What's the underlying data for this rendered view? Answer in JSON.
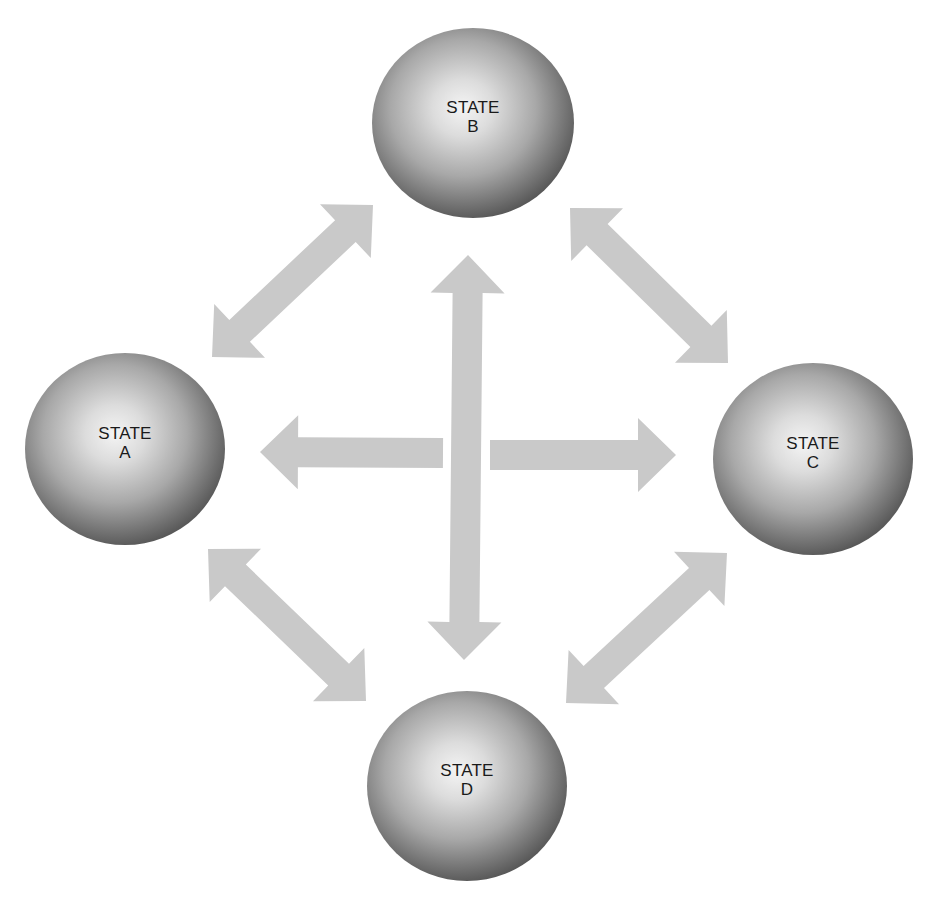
{
  "diagram": {
    "type": "state-transition",
    "colors": {
      "background": "#ffffff",
      "arrow": "#c9c9c9",
      "sphere_highlight": "#f4f4f4",
      "sphere_mid": "#b0b0b0",
      "sphere_edge": "#5a5a5a",
      "label": "#1a1a1a"
    },
    "states": [
      {
        "id": "A",
        "line1": "STATE",
        "line2": "A",
        "cx": 125,
        "cy": 449,
        "rx": 100,
        "ry": 96
      },
      {
        "id": "B",
        "line1": "STATE",
        "line2": "B",
        "cx": 473,
        "cy": 123,
        "rx": 101,
        "ry": 95
      },
      {
        "id": "C",
        "line1": "STATE",
        "line2": "C",
        "cx": 813,
        "cy": 459,
        "rx": 100,
        "ry": 96
      },
      {
        "id": "D",
        "line1": "STATE",
        "line2": "D",
        "cx": 467,
        "cy": 786,
        "rx": 100,
        "ry": 95
      }
    ],
    "transitions": [
      {
        "name": "A-B",
        "from": [
          212,
          357
        ],
        "to": [
          373,
          205
        ],
        "bidirectional": true
      },
      {
        "name": "B-C",
        "from": [
          570,
          208
        ],
        "to": [
          728,
          363
        ],
        "bidirectional": true
      },
      {
        "name": "A-D",
        "from": [
          208,
          549
        ],
        "to": [
          366,
          701
        ],
        "bidirectional": true
      },
      {
        "name": "C-D",
        "from": [
          727,
          553
        ],
        "to": [
          566,
          703
        ],
        "bidirectional": true
      },
      {
        "name": "B-D",
        "from": [
          468,
          255
        ],
        "to": [
          464,
          660
        ],
        "bidirectional": true
      },
      {
        "name": "center-to-A",
        "from": [
          443,
          453
        ],
        "to": [
          260,
          452
        ],
        "bidirectional": false
      },
      {
        "name": "center-to-C",
        "from": [
          490,
          455
        ],
        "to": [
          676,
          455
        ],
        "bidirectional": false
      }
    ]
  }
}
